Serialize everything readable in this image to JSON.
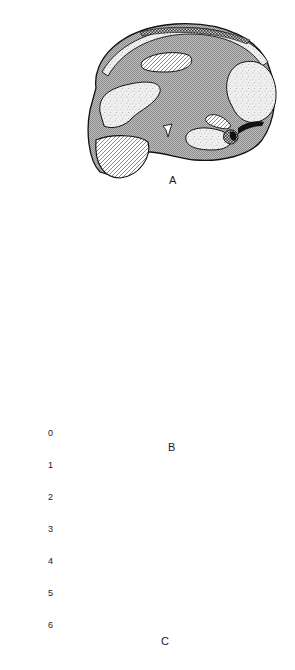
{
  "figure": {
    "panels": [
      {
        "id": "A",
        "label": "A",
        "view": "lateral"
      },
      {
        "id": "B",
        "label": "B",
        "view": "dorsal"
      },
      {
        "id": "C",
        "label": "C",
        "view": "frontal"
      }
    ]
  },
  "legend": {
    "ticks": [
      "0",
      "1",
      "2",
      "3",
      "4",
      "5",
      "6"
    ],
    "bands": [
      {
        "range": "0-1",
        "pattern": "diagonal-hatch",
        "color": "#ffffff"
      },
      {
        "range": "1-2",
        "pattern": "fine-crosshatch-gray",
        "color": "#a8a8a8"
      },
      {
        "range": "2-3",
        "pattern": "stipple-light",
        "color": "#e6e6e6"
      },
      {
        "range": "3-4",
        "pattern": "checker-dark",
        "color": "#6e6e6e"
      },
      {
        "range": "4-5",
        "pattern": "vertical-lines-dark",
        "color": "#4a4a4a"
      },
      {
        "range": "5-6",
        "pattern": "solid-black",
        "color": "#0a0a0a"
      }
    ]
  }
}
